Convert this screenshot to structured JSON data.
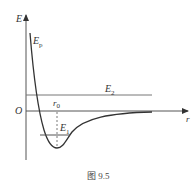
{
  "figure": {
    "caption": "图 9.5",
    "axes": {
      "y_label": "E",
      "x_label": "r",
      "origin_label": "O"
    },
    "curve_label": "E",
    "curve_label_sub": "p",
    "levels": [
      {
        "label": "E",
        "sub": "2"
      },
      {
        "label": "E",
        "sub": "1"
      }
    ],
    "marker": {
      "label": "r",
      "sub": "0"
    },
    "colors": {
      "line": "#333333",
      "axis": "#555555",
      "background": "#ffffff"
    }
  }
}
